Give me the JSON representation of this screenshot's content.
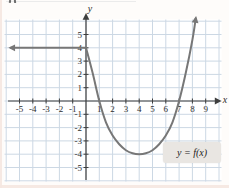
{
  "colors": {
    "grid": "#ccd8e4",
    "plot_bg": "#ffffff",
    "axis": "#3e3e3e",
    "tick_text": "#2e2e2e",
    "curve": "#777777",
    "annotation_bg": "#e9e6e2",
    "annotation_text": "#1c1c1c"
  },
  "chart_data": {
    "type": "line",
    "title": "",
    "xlabel": "x",
    "ylabel": "y",
    "xlim": [
      -6.2,
      10.3
    ],
    "ylim": [
      -6.2,
      6.5
    ],
    "grid": true,
    "legend": "none",
    "x_ticks": [
      -5,
      -4,
      -3,
      -2,
      -1,
      1,
      2,
      3,
      4,
      5,
      6,
      7,
      8,
      9
    ],
    "y_ticks": [
      5,
      4,
      3,
      2,
      1,
      -1,
      -2,
      -3,
      -4,
      -5
    ],
    "series": [
      {
        "name": "constant-ray",
        "description": "horizontal ray y = 4 for x <= 0, arrow pointing left",
        "points": [
          [
            -5.65,
            4
          ],
          [
            0,
            4
          ]
        ],
        "arrow_at": "start"
      },
      {
        "name": "parabolic-branch",
        "description": "parabola-shaped curve from (0,4), x-intercepts at 1 and 7, vertex (4,-4), rising with arrow up-right",
        "points": [
          [
            0,
            4
          ],
          [
            0.5,
            2.1
          ],
          [
            1,
            0
          ],
          [
            1.5,
            -1.6
          ],
          [
            2,
            -2.6
          ],
          [
            2.5,
            -3.25
          ],
          [
            3,
            -3.7
          ],
          [
            3.5,
            -3.93
          ],
          [
            4,
            -4
          ],
          [
            4.5,
            -3.93
          ],
          [
            5,
            -3.7
          ],
          [
            5.5,
            -3.25
          ],
          [
            6,
            -2.6
          ],
          [
            6.5,
            -1.6
          ],
          [
            7,
            0
          ],
          [
            7.5,
            2.1
          ],
          [
            8,
            4.6
          ],
          [
            8.25,
            6.2
          ]
        ],
        "arrow_at": "end"
      }
    ],
    "annotations": [
      {
        "text": "y = f(x)",
        "x": 6.6,
        "y": -3.5,
        "boxed": true
      }
    ]
  }
}
